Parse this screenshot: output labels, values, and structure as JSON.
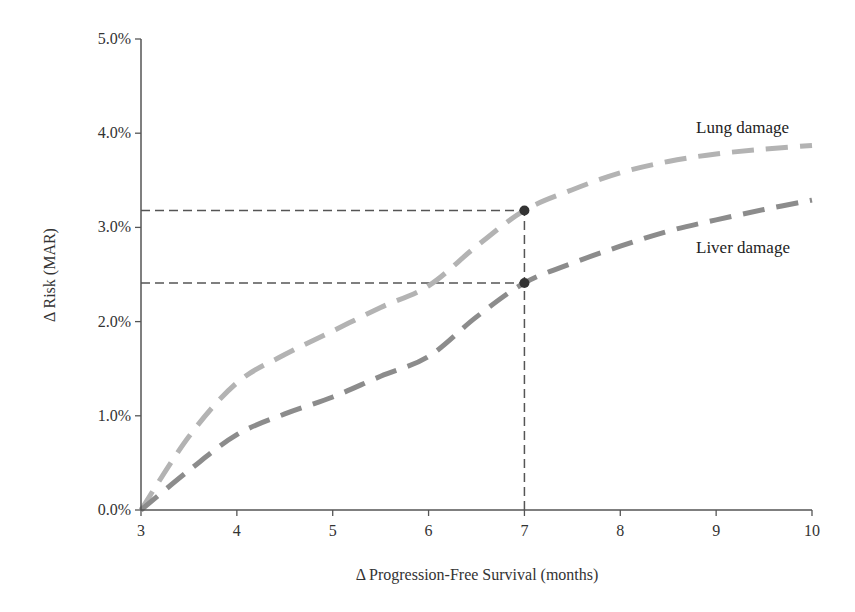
{
  "chart_data": {
    "type": "line",
    "title": "",
    "xlabel": "Δ Progression-Free Survival (months)",
    "ylabel": "Δ Risk (MAR)",
    "xlim": [
      3,
      10
    ],
    "ylim": [
      0,
      5
    ],
    "x_ticks": [
      "3",
      "4",
      "5",
      "6",
      "7",
      "8",
      "9",
      "10"
    ],
    "y_ticks": [
      "0.0%",
      "1.0%",
      "2.0%",
      "3.0%",
      "4.0%",
      "5.0%"
    ],
    "grid": false,
    "legend": "inline labels",
    "series": [
      {
        "name": "Lung damage",
        "color": "#b3b3b3",
        "style": "dashed",
        "x": [
          3,
          3.5,
          4,
          4.5,
          5,
          5.5,
          6,
          6.5,
          7,
          7.5,
          8,
          8.5,
          9,
          9.5,
          10
        ],
        "y": [
          0.0,
          0.78,
          1.35,
          1.65,
          1.9,
          2.15,
          2.38,
          2.8,
          3.18,
          3.4,
          3.58,
          3.7,
          3.78,
          3.83,
          3.87
        ]
      },
      {
        "name": "Liver damage",
        "color": "#8c8c8c",
        "style": "dashed",
        "x": [
          3,
          3.5,
          4,
          4.5,
          5,
          5.5,
          6,
          6.5,
          7,
          7.5,
          8,
          8.5,
          9,
          9.5,
          10
        ],
        "y": [
          0.0,
          0.42,
          0.8,
          1.02,
          1.2,
          1.42,
          1.63,
          2.05,
          2.41,
          2.62,
          2.8,
          2.96,
          3.08,
          3.19,
          3.29
        ]
      }
    ],
    "reference_points": [
      {
        "x": 7,
        "y": 3.18,
        "series": "Lung damage"
      },
      {
        "x": 7,
        "y": 2.41,
        "series": "Liver damage"
      }
    ],
    "reference_lines": [
      {
        "type": "horizontal",
        "y": 3.18,
        "x_from": 3,
        "x_to": 7
      },
      {
        "type": "horizontal",
        "y": 2.41,
        "x_from": 3,
        "x_to": 7
      },
      {
        "type": "vertical",
        "x": 7,
        "y_from": 0,
        "y_to": 3.18
      }
    ]
  },
  "labels": {
    "lung": "Lung damage",
    "liver": "Liver damage"
  }
}
